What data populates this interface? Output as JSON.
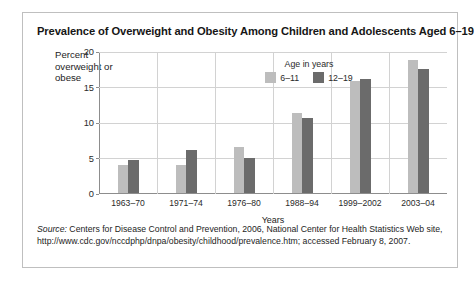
{
  "figure": {
    "title": "Prevalence of Overweight and Obesity Among Children and Adolescents Aged 6–19",
    "source_word": "Source:",
    "source_line1": " Centers for Disease Control and Prevention, 2006, National Center for Health Statistics Web site,",
    "source_line2": "http://www.cdc.gov/nccdphp/dnpa/obesity/childhood/prevalence.htm; accessed February 8, 2007."
  },
  "chart_data": {
    "type": "bar",
    "title": "Prevalence of Overweight and Obesity Among Children and Adolescents Aged 6–19",
    "xlabel": "Years",
    "ylabel": "Percent overweight or obese",
    "ylim": [
      0,
      20
    ],
    "yticks": [
      0,
      5,
      10,
      15,
      20
    ],
    "ytick_labels": [
      "0",
      "5",
      "10",
      "15",
      "20"
    ],
    "grid": true,
    "grid_axis": "both",
    "legend_title": "Age in years",
    "legend_position": "inside-top-center",
    "categories": [
      "1963–70",
      "1971–74",
      "1976–80",
      "1988–94",
      "1999–2002",
      "2003–04"
    ],
    "series": [
      {
        "name": "6–11",
        "color": "#bdbdbd",
        "values": [
          4.0,
          4.0,
          6.5,
          11.3,
          15.8,
          18.8
        ]
      },
      {
        "name": "12–19",
        "color": "#6b6b6b",
        "values": [
          4.6,
          6.1,
          5.0,
          10.5,
          16.0,
          17.4
        ]
      }
    ]
  },
  "colors": {
    "series_light": "#bdbdbd",
    "series_dark": "#6b6b6b",
    "grid": "#d2d2d2",
    "axis": "#8d8d8d",
    "box_border": "#bfbfbf",
    "text": "#1d1d1d"
  }
}
